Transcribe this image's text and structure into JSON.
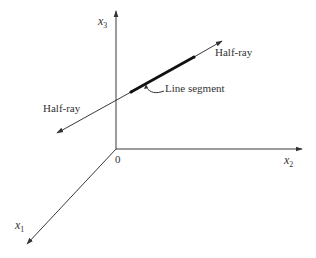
{
  "diagram": {
    "axes": {
      "x1": {
        "label": "x",
        "subscript": "1"
      },
      "x2": {
        "label": "x",
        "subscript": "2"
      },
      "x3": {
        "label": "x",
        "subscript": "3"
      },
      "origin_label": "0"
    },
    "labels": {
      "half_ray_right": "Half-ray",
      "half_ray_left": "Half-ray",
      "line_segment": "Line segment"
    },
    "colors": {
      "line": "#3a3a3a",
      "segment": "#111111",
      "text": "#333333"
    }
  }
}
